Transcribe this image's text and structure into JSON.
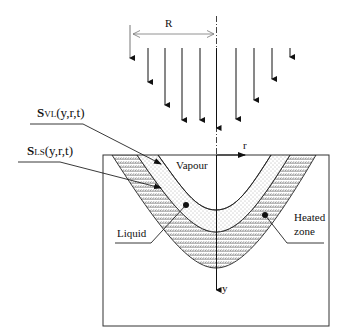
{
  "diagram": {
    "beam": {
      "radius_label": "R",
      "arrow_count": 10
    },
    "axes": {
      "r_label": "r",
      "y_label": "y"
    },
    "interfaces": {
      "vl": {
        "symbol": "S",
        "subscript": "VL",
        "args": "(y,r,t)"
      },
      "ls": {
        "symbol": "S",
        "subscript": "LS",
        "args": "(y,r,t)"
      }
    },
    "regions": {
      "vapour": "Vapour",
      "liquid": "Liquid",
      "heated_line1": "Heated",
      "heated_line2": "zone"
    }
  }
}
